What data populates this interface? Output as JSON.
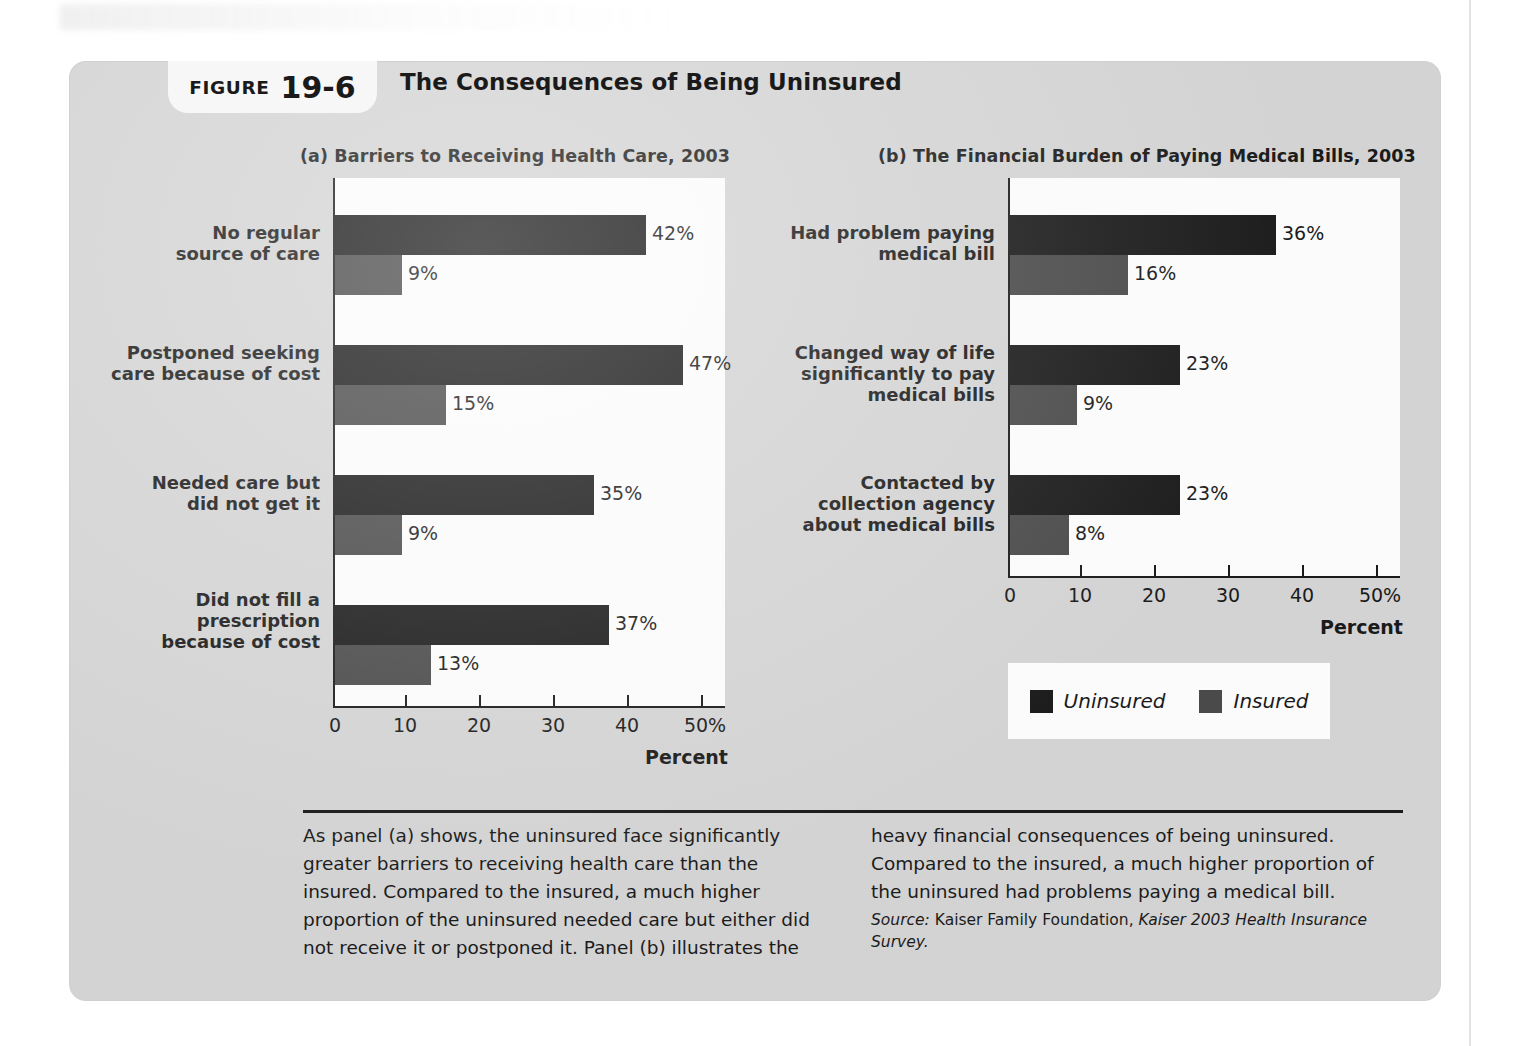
{
  "figure": {
    "badge_word": "FIGURE",
    "badge_number": "19-6",
    "title": "The Consequences of Being Uninsured"
  },
  "panel_a": {
    "title": "(a)  Barriers to Receiving Health Care, 2003",
    "axis_label": "Percent",
    "tick_labels": [
      "0",
      "10",
      "20",
      "30",
      "40",
      "50%"
    ],
    "categories": [
      "No regular\nsource of care",
      "Postponed seeking\ncare because of cost",
      "Needed care but\ndid not get it",
      "Did not fill a\nprescription\nbecause of cost"
    ],
    "uninsured_labels": [
      "42%",
      "47%",
      "35%",
      "37%"
    ],
    "insured_labels": [
      "9%",
      "15%",
      "9%",
      "13%"
    ]
  },
  "panel_b": {
    "title": "(b)  The Financial Burden of Paying Medical Bills, 2003",
    "axis_label": "Percent",
    "tick_labels": [
      "0",
      "10",
      "20",
      "30",
      "40",
      "50%"
    ],
    "categories": [
      "Had problem paying\nmedical bill",
      "Changed way of life\nsignificantly to pay\nmedical bills",
      "Contacted by\ncollection agency\nabout medical bills"
    ],
    "uninsured_labels": [
      "36%",
      "23%",
      "23%"
    ],
    "insured_labels": [
      "16%",
      "9%",
      "8%"
    ]
  },
  "legend": {
    "items": [
      {
        "label": "Uninsured",
        "color": "#1b1b1b"
      },
      {
        "label": "Insured",
        "color": "#4a4a4a"
      }
    ]
  },
  "caption": {
    "left": "As panel (a) shows, the uninsured face significantly greater barriers to receiving health care than the insured. Compared to the insured, a much higher proportion of the uninsured needed care but either did not receive it or postponed it. Panel (b) illustrates the",
    "right": "heavy financial consequences of being uninsured. Compared to the insured, a much higher proportion of the uninsured had problems paying a medical bill.",
    "source_label": "Source:",
    "source_org": " Kaiser Family Foundation, ",
    "source_title": "Kaiser 2003 Health Insurance Survey."
  },
  "chart_data": [
    {
      "type": "bar",
      "title": "(a)  Barriers to Receiving Health Care, 2003",
      "orientation": "horizontal",
      "xlabel": "Percent",
      "ylabel": "",
      "xlim": [
        0,
        53
      ],
      "xticks": [
        0,
        10,
        20,
        30,
        40,
        50
      ],
      "grid": false,
      "categories": [
        "No regular source of care",
        "Postponed seeking care because of cost",
        "Needed care but did not get it",
        "Did not fill a prescription because of cost"
      ],
      "series": [
        {
          "name": "Uninsured",
          "color": "#1b1b1b",
          "values": [
            42,
            47,
            35,
            37
          ]
        },
        {
          "name": "Insured",
          "color": "#4a4a4a",
          "values": [
            9,
            15,
            9,
            13
          ]
        }
      ],
      "legend_position": "below-right"
    },
    {
      "type": "bar",
      "title": "(b)  The Financial Burden of Paying Medical Bills, 2003",
      "orientation": "horizontal",
      "xlabel": "Percent",
      "ylabel": "",
      "xlim": [
        0,
        53
      ],
      "xticks": [
        0,
        10,
        20,
        30,
        40,
        50
      ],
      "grid": false,
      "categories": [
        "Had problem paying medical bill",
        "Changed way of life significantly to pay medical bills",
        "Contacted by collection agency about medical bills"
      ],
      "series": [
        {
          "name": "Uninsured",
          "color": "#1b1b1b",
          "values": [
            36,
            23,
            23
          ]
        },
        {
          "name": "Insured",
          "color": "#4a4a4a",
          "values": [
            16,
            9,
            8
          ]
        }
      ],
      "legend_position": "below-right"
    }
  ]
}
